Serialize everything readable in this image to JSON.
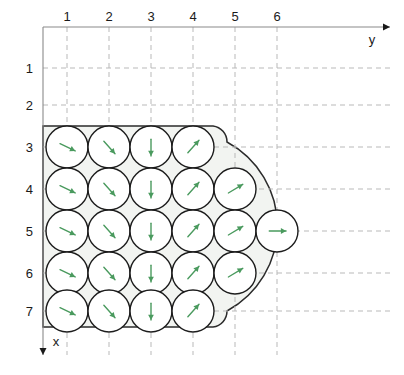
{
  "figure": {
    "title": ""
  },
  "axes": {
    "horizontal": {
      "name": "y",
      "direction": "right",
      "origin_px": [
        43,
        27
      ],
      "end_px": [
        390,
        27
      ],
      "tick_labels": [
        "1",
        "2",
        "3",
        "4",
        "5",
        "6"
      ],
      "tick_positions_px": [
        67,
        109,
        151,
        193,
        235,
        277
      ]
    },
    "vertical": {
      "name": "x",
      "direction": "down",
      "origin_px": [
        43,
        27
      ],
      "end_px": [
        43,
        355
      ],
      "tick_labels": [
        "1",
        "2",
        "3",
        "4",
        "5",
        "6",
        "7"
      ],
      "tick_positions_px": [
        68,
        105,
        147,
        189,
        231,
        273,
        311
      ]
    }
  },
  "colors": {
    "vector": "#4a9a5e",
    "circle_stroke": "#1c1c1c",
    "domain_fill": "#f2f4f1",
    "domain_stroke": "#2b2b2b",
    "grid": "#b9b9b9",
    "axis": "#8a8a8a",
    "text": "#1a1a1a"
  },
  "geometry": {
    "circle_radius_px": 21,
    "col_spacing_px": 42,
    "row_spacing_px": 42,
    "col_x_px": [
      67,
      109,
      151,
      193,
      235,
      277
    ],
    "row_y_px": [
      147,
      189,
      231,
      273,
      311
    ],
    "row_labels": [
      "3",
      "4",
      "5",
      "6",
      "7"
    ],
    "boundary_rect": {
      "x": 43,
      "y": 126,
      "width": 170,
      "height": 201
    },
    "bulge_center_px": [
      213,
      231
    ],
    "bulge_radius_px": 96
  },
  "chart_data": {
    "type": "scatter",
    "title": "",
    "xlabel": "y",
    "ylabel": "x",
    "grid": true,
    "legend": "none",
    "cells": [
      {
        "row": 3,
        "col": 1,
        "cx": 67,
        "cy": 147,
        "dx": 1.0,
        "dy": 0.48
      },
      {
        "row": 3,
        "col": 2,
        "cx": 109,
        "cy": 147,
        "dx": 0.8,
        "dy": 0.9
      },
      {
        "row": 3,
        "col": 3,
        "cx": 151,
        "cy": 147,
        "dx": 0.0,
        "dy": 1.0
      },
      {
        "row": 3,
        "col": 4,
        "cx": 193,
        "cy": 147,
        "dx": 0.8,
        "dy": -0.9
      },
      {
        "row": 4,
        "col": 1,
        "cx": 67,
        "cy": 189,
        "dx": 1.0,
        "dy": 0.48
      },
      {
        "row": 4,
        "col": 2,
        "cx": 109,
        "cy": 189,
        "dx": 0.8,
        "dy": 0.9
      },
      {
        "row": 4,
        "col": 3,
        "cx": 151,
        "cy": 189,
        "dx": 0.0,
        "dy": 1.0
      },
      {
        "row": 4,
        "col": 4,
        "cx": 193,
        "cy": 189,
        "dx": 0.8,
        "dy": -0.9
      },
      {
        "row": 4,
        "col": 5,
        "cx": 235,
        "cy": 189,
        "dx": 1.0,
        "dy": -0.6
      },
      {
        "row": 5,
        "col": 1,
        "cx": 67,
        "cy": 231,
        "dx": 1.0,
        "dy": 0.48
      },
      {
        "row": 5,
        "col": 2,
        "cx": 109,
        "cy": 231,
        "dx": 0.8,
        "dy": 0.9
      },
      {
        "row": 5,
        "col": 3,
        "cx": 151,
        "cy": 231,
        "dx": 0.0,
        "dy": 1.0
      },
      {
        "row": 5,
        "col": 4,
        "cx": 193,
        "cy": 231,
        "dx": 0.8,
        "dy": -0.9
      },
      {
        "row": 5,
        "col": 5,
        "cx": 235,
        "cy": 231,
        "dx": 1.0,
        "dy": -0.6
      },
      {
        "row": 5,
        "col": 6,
        "cx": 277,
        "cy": 231,
        "dx": 1.0,
        "dy": 0.0
      },
      {
        "row": 6,
        "col": 1,
        "cx": 67,
        "cy": 273,
        "dx": 1.0,
        "dy": 0.48
      },
      {
        "row": 6,
        "col": 2,
        "cx": 109,
        "cy": 273,
        "dx": 0.8,
        "dy": 0.9
      },
      {
        "row": 6,
        "col": 3,
        "cx": 151,
        "cy": 273,
        "dx": 0.0,
        "dy": 1.0
      },
      {
        "row": 6,
        "col": 4,
        "cx": 193,
        "cy": 273,
        "dx": 0.8,
        "dy": -0.9
      },
      {
        "row": 6,
        "col": 5,
        "cx": 235,
        "cy": 273,
        "dx": 1.0,
        "dy": -0.6
      },
      {
        "row": 7,
        "col": 1,
        "cx": 67,
        "cy": 311,
        "dx": 1.0,
        "dy": 0.48
      },
      {
        "row": 7,
        "col": 2,
        "cx": 109,
        "cy": 311,
        "dx": 0.8,
        "dy": 0.9
      },
      {
        "row": 7,
        "col": 3,
        "cx": 151,
        "cy": 311,
        "dx": 0.0,
        "dy": 1.0
      },
      {
        "row": 7,
        "col": 4,
        "cx": 193,
        "cy": 311,
        "dx": 0.8,
        "dy": -0.9
      }
    ]
  }
}
